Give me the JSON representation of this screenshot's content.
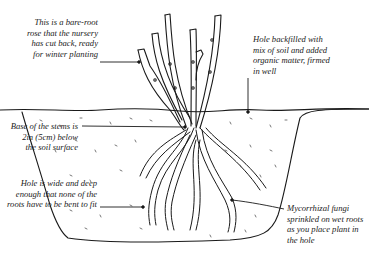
{
  "diagram": {
    "annotations": [
      {
        "id": "bare-root",
        "lines": [
          "This is a bare-root",
          "rose that the nursery",
          "has cut back, ready",
          "for winter planting"
        ]
      },
      {
        "id": "backfill",
        "lines": [
          "Hole backfilled with",
          "mix of soil and added",
          "organic matter, firmed",
          "in well"
        ]
      },
      {
        "id": "stem-base",
        "lines": [
          "Base of the stems is",
          "2in (5cm) below",
          "the soil surface"
        ]
      },
      {
        "id": "hole-size",
        "lines": [
          "Hole is wide and deep",
          "enough that none of the",
          "roots have to be bent to fit"
        ]
      },
      {
        "id": "fungi",
        "lines": [
          "Mycorrhizal fungi",
          "sprinkled on wet roots",
          "as you place plant in",
          "the hole"
        ]
      }
    ]
  }
}
